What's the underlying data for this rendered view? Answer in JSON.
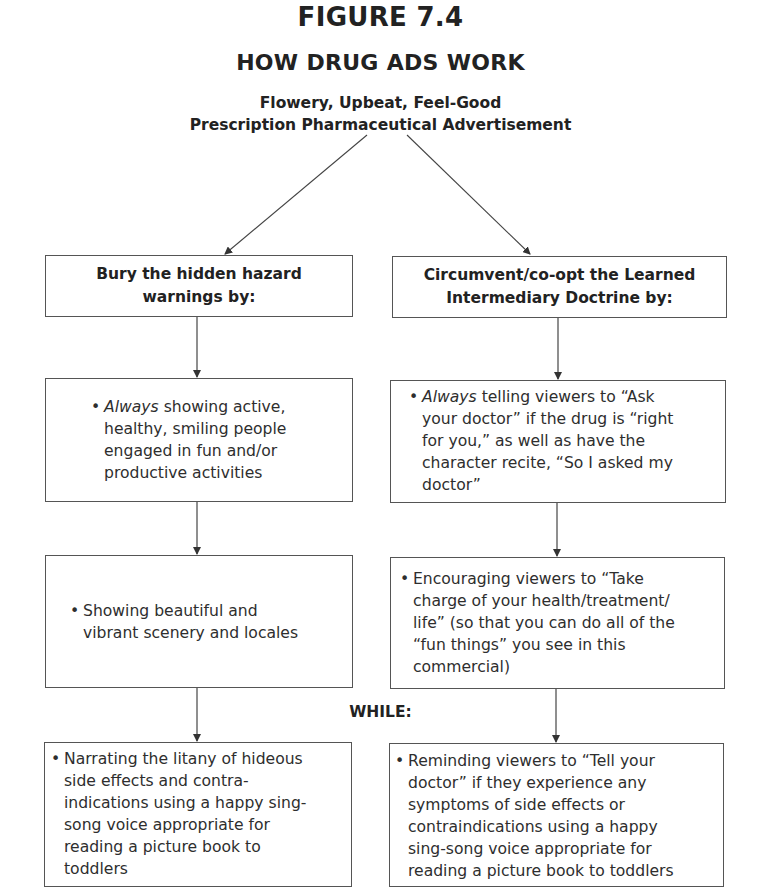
{
  "figure": {
    "label": "FIGURE 7.4",
    "title": "HOW DRUG ADS WORK",
    "subtitle_lines": [
      "Flowery, Upbeat, Feel-Good",
      "Prescription Pharmaceutical Advertisement"
    ]
  },
  "left_column": {
    "header_lines": [
      "Bury the hidden hazard",
      "warnings by:"
    ],
    "items": [
      {
        "bullet": "•",
        "italic_lead": "Always",
        "lines": [
          " showing active,",
          "healthy, smiling people",
          "engaged in fun and/or",
          "productive activities"
        ]
      },
      {
        "bullet": "•",
        "italic_lead": "",
        "lines": [
          "Showing beautiful and",
          "vibrant scenery and locales"
        ]
      },
      {
        "bullet": "•",
        "italic_lead": "",
        "lines": [
          "Narrating the litany of hideous",
          "side effects and contra-",
          "indications using a happy sing-",
          "song voice appropriate for",
          "reading a picture book to",
          "toddlers"
        ]
      }
    ]
  },
  "right_column": {
    "header_lines": [
      "Circumvent/co-opt the Learned",
      "Intermediary Doctrine by:"
    ],
    "items": [
      {
        "bullet": "•",
        "italic_lead": "Always",
        "lines": [
          " telling viewers to “Ask",
          "your doctor” if the drug is “right",
          "for you,” as well as have the",
          "character recite, “So I asked my",
          "doctor”"
        ]
      },
      {
        "bullet": "•",
        "italic_lead": "",
        "lines": [
          "Encouraging viewers to “Take",
          "charge of your health/treatment/",
          "life” (so that you can do all of the",
          "“fun things” you see in this",
          "commercial)"
        ]
      },
      {
        "bullet": "•",
        "italic_lead": "",
        "lines": [
          "Reminding viewers to “Tell your",
          "doctor” if they experience any",
          "symptoms of side effects or",
          "contraindications using a happy",
          "sing-song voice appropriate for",
          "reading a picture book to toddlers"
        ]
      }
    ]
  },
  "connector_label": "WHILE:",
  "colors": {
    "text": "#2a2a2a",
    "border": "#555555",
    "arrow": "#333333",
    "background": "#ffffff"
  }
}
